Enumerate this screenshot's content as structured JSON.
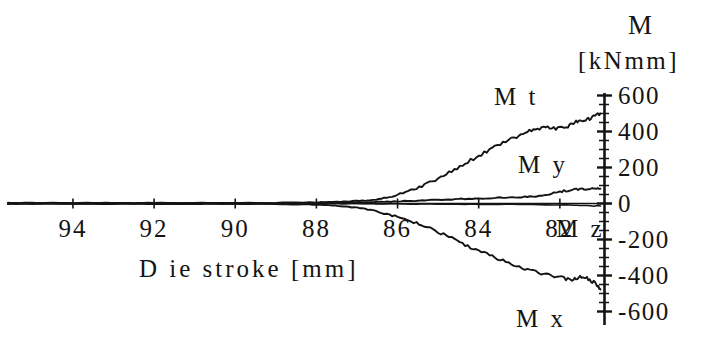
{
  "figure": {
    "background_color": "#ffffff",
    "ink_color": "#141414"
  },
  "axis_title": {
    "symbol": "M",
    "units": "[kNmm]"
  },
  "x_axis_caption": "D ie stroke [mm]",
  "curve_labels": {
    "mt": "M t",
    "my": "M y",
    "mz": "M z",
    "mx": "M x"
  },
  "chart_data": {
    "type": "line",
    "title": "",
    "subtitle": "",
    "xlabel": "D ie stroke [mm]",
    "ylabel": "M [kNmm]",
    "xlim": [
      95.6,
      80.9
    ],
    "ylim": [
      -600,
      600
    ],
    "x_inverted": true,
    "grid": false,
    "legend": "inline-annotations",
    "xticks": [
      94,
      92,
      90,
      88,
      86,
      84,
      82
    ],
    "xtick_labels": [
      "94",
      "92",
      "90",
      "88",
      "86",
      "84",
      "82"
    ],
    "yticks": [
      600,
      400,
      200,
      0,
      -200,
      -400,
      -600
    ],
    "ytick_labels": [
      "600",
      "400",
      "200",
      "0",
      "-200",
      "-400",
      "-600"
    ],
    "y_minor_tick_step": 50,
    "annotations": [
      {
        "text": "M t",
        "x": 82.6,
        "y": 430
      },
      {
        "text": "M y",
        "x": 82.0,
        "y": 125
      },
      {
        "text": "M z",
        "x": 81.3,
        "y": -70
      },
      {
        "text": "M x",
        "x": 81.9,
        "y": -400
      }
    ],
    "series": [
      {
        "name": "Mt",
        "x": [
          95.6,
          95.0,
          94.0,
          93.0,
          92.0,
          91.0,
          90.0,
          89.0,
          88.0,
          87.4,
          87.0,
          86.6,
          86.2,
          85.8,
          85.4,
          85.0,
          84.6,
          84.2,
          83.8,
          83.4,
          83.0,
          82.7,
          82.4,
          82.1,
          81.8,
          81.6,
          81.4,
          81.2,
          81.0
        ],
        "y": [
          3,
          3,
          3,
          3,
          3,
          3,
          3,
          4,
          6,
          10,
          14,
          20,
          36,
          62,
          98,
          140,
          190,
          240,
          290,
          338,
          378,
          408,
          424,
          416,
          430,
          452,
          462,
          478,
          500
        ]
      },
      {
        "name": "My",
        "x": [
          95.6,
          95.0,
          94.0,
          93.0,
          92.0,
          91.0,
          90.0,
          89.0,
          88.0,
          87.0,
          86.5,
          86.0,
          85.5,
          85.0,
          84.5,
          84.0,
          83.5,
          83.0,
          82.6,
          82.3,
          82.0,
          81.7,
          81.4,
          81.2,
          81.0
        ],
        "y": [
          2,
          2,
          2,
          2,
          2,
          2,
          2,
          2,
          3,
          5,
          8,
          12,
          16,
          20,
          24,
          28,
          32,
          36,
          40,
          48,
          66,
          76,
          80,
          82,
          82
        ]
      },
      {
        "name": "Mz",
        "x": [
          95.6,
          95.0,
          94.0,
          93.0,
          92.0,
          91.0,
          90.0,
          89.0,
          88.0,
          87.0,
          86.0,
          85.0,
          84.0,
          83.0,
          82.0,
          81.5,
          81.0
        ],
        "y": [
          0,
          0,
          0,
          0,
          0,
          0,
          0,
          0,
          0,
          -1,
          -2,
          -3,
          -4,
          -5,
          -7,
          -10,
          -14
        ]
      },
      {
        "name": "Mx",
        "x": [
          95.6,
          95.0,
          94.0,
          93.0,
          92.0,
          91.0,
          90.0,
          89.0,
          88.2,
          87.6,
          87.2,
          86.8,
          86.4,
          86.0,
          85.6,
          85.2,
          84.8,
          84.4,
          84.0,
          83.6,
          83.2,
          82.8,
          82.4,
          82.0,
          81.7,
          81.5,
          81.3,
          81.1,
          81.0
        ],
        "y": [
          -2,
          -2,
          -2,
          -2,
          -2,
          -2,
          -2,
          -3,
          -5,
          -10,
          -18,
          -30,
          -50,
          -74,
          -104,
          -140,
          -180,
          -222,
          -262,
          -300,
          -334,
          -366,
          -392,
          -410,
          -426,
          -404,
          -418,
          -448,
          -478
        ]
      }
    ]
  }
}
